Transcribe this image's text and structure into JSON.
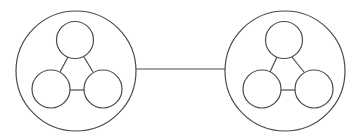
{
  "canvas": {
    "width": 356,
    "height": 137,
    "background": "#ffffff"
  },
  "style": {
    "stroke": "#4a4a4a"
  },
  "groups": [
    {
      "id": "left-cluster",
      "outer": {
        "cx": 76,
        "cy": 71,
        "r": 60
      },
      "inner": [
        {
          "id": "top",
          "cx": 75,
          "cy": 40,
          "r": 18.5
        },
        {
          "id": "bottom-left",
          "cx": 51,
          "cy": 89,
          "r": 19
        },
        {
          "id": "bottom-right",
          "cx": 103,
          "cy": 89,
          "r": 19
        }
      ],
      "edges": [
        {
          "from": "top",
          "to": "bottom-left",
          "x1": 68,
          "y1": 57,
          "x2": 60,
          "y2": 72
        },
        {
          "from": "top",
          "to": "bottom-right",
          "x1": 84,
          "y1": 57,
          "x2": 93,
          "y2": 72
        },
        {
          "from": "bottom-left",
          "to": "bottom-right",
          "x1": 70,
          "y1": 90,
          "x2": 84,
          "y2": 90
        }
      ]
    },
    {
      "id": "right-cluster",
      "outer": {
        "cx": 285,
        "cy": 71,
        "r": 60
      },
      "inner": [
        {
          "id": "top",
          "cx": 284,
          "cy": 40,
          "r": 18.5
        },
        {
          "id": "bottom-left",
          "cx": 262,
          "cy": 89,
          "r": 19
        },
        {
          "id": "bottom-right",
          "cx": 314,
          "cy": 89,
          "r": 19
        }
      ],
      "edges": [
        {
          "from": "top",
          "to": "bottom-left",
          "x1": 277,
          "y1": 57,
          "x2": 270,
          "y2": 72
        },
        {
          "from": "top",
          "to": "bottom-right",
          "x1": 292,
          "y1": 57,
          "x2": 304,
          "y2": 72
        },
        {
          "from": "bottom-left",
          "to": "bottom-right",
          "x1": 281,
          "y1": 90,
          "x2": 295,
          "y2": 90
        }
      ]
    }
  ],
  "links": [
    {
      "from": "left-cluster",
      "to": "right-cluster",
      "x1": 136,
      "y1": 69,
      "x2": 225,
      "y2": 69
    }
  ]
}
